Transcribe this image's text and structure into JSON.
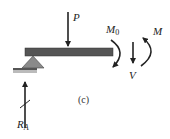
{
  "diagram": {
    "caption": "(c)",
    "labels": {
      "load": "P",
      "moment_applied": "M",
      "moment_applied_sub": "0",
      "shear": "V",
      "moment_internal": "M",
      "reaction": "R",
      "reaction_sub": "A"
    },
    "colors": {
      "beam": "#555555",
      "support": "#8a8a8a",
      "arrows": "#222222"
    }
  }
}
